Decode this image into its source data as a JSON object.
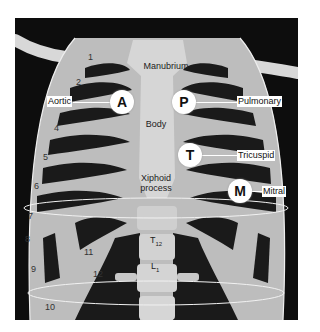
{
  "figure": {
    "structures": {
      "manubrium": "Manubrium",
      "body": "Body",
      "xiphoid_line1": "Xiphoid",
      "xiphoid_line2": "process",
      "t12_main": "T",
      "t12_sub": "12",
      "l1_main": "L",
      "l1_sub": "1"
    },
    "auscultation_points": [
      {
        "letter": "A",
        "label": "Aortic"
      },
      {
        "letter": "P",
        "label": "Pulmonary"
      },
      {
        "letter": "T",
        "label": "Tricuspid"
      },
      {
        "letter": "M",
        "label": "Mitral"
      }
    ],
    "rib_numbers": [
      "1",
      "2",
      "4",
      "5",
      "6",
      "7",
      "8",
      "9",
      "10",
      "11",
      "12"
    ],
    "colors": {
      "background": "#0d0d0d",
      "bone": "#c9c9c9",
      "bone_light": "#dedede",
      "marker_fill": "#ffffff",
      "guide_lines": "#f2f2f2"
    }
  }
}
